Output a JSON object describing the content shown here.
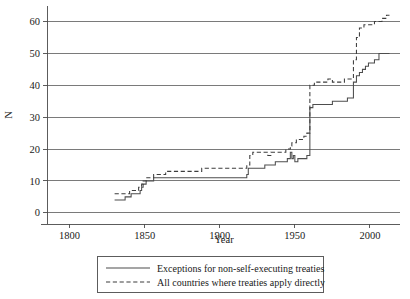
{
  "chart_data": {
    "type": "line",
    "title": "",
    "subtitle": "",
    "xlabel": "Year",
    "ylabel": "N",
    "xlim": [
      1785,
      2020
    ],
    "ylim": [
      -1,
      63
    ],
    "xticks": [
      1800,
      1850,
      1900,
      1950,
      2000
    ],
    "xtick_labels": [
      "1800",
      "1850",
      "1900",
      "1950",
      "2000"
    ],
    "yticks": [
      0,
      10,
      20,
      30,
      40,
      50,
      60
    ],
    "ytick_labels": [
      "0",
      "10",
      "20",
      "30",
      "40",
      "50",
      "60"
    ],
    "grid": "horizontal",
    "legend_position": "below-center",
    "series": [
      {
        "name": "Exceptions for non-self-executing treaties",
        "style": "solid",
        "color": "#4d4d4d",
        "points": [
          [
            1830,
            4
          ],
          [
            1837,
            4
          ],
          [
            1837,
            5
          ],
          [
            1841,
            5
          ],
          [
            1841,
            6
          ],
          [
            1847,
            6
          ],
          [
            1847,
            7
          ],
          [
            1848,
            7
          ],
          [
            1848,
            8
          ],
          [
            1849,
            8
          ],
          [
            1849,
            9
          ],
          [
            1851,
            9
          ],
          [
            1851,
            10
          ],
          [
            1856,
            10
          ],
          [
            1856,
            11
          ],
          [
            1918,
            11
          ],
          [
            1918,
            12
          ],
          [
            1919,
            12
          ],
          [
            1919,
            14
          ],
          [
            1930,
            14
          ],
          [
            1930,
            15
          ],
          [
            1937,
            15
          ],
          [
            1937,
            16
          ],
          [
            1945,
            16
          ],
          [
            1945,
            17
          ],
          [
            1947,
            17
          ],
          [
            1947,
            19
          ],
          [
            1948,
            19
          ],
          [
            1948,
            17
          ],
          [
            1949,
            17
          ],
          [
            1949,
            18
          ],
          [
            1950,
            18
          ],
          [
            1950,
            16
          ],
          [
            1952,
            16
          ],
          [
            1952,
            17
          ],
          [
            1958,
            17
          ],
          [
            1958,
            18
          ],
          [
            1960,
            18
          ],
          [
            1960,
            33
          ],
          [
            1962,
            33
          ],
          [
            1962,
            34
          ],
          [
            1975,
            34
          ],
          [
            1975,
            35
          ],
          [
            1985,
            35
          ],
          [
            1985,
            36
          ],
          [
            1989,
            36
          ],
          [
            1989,
            41
          ],
          [
            1991,
            41
          ],
          [
            1991,
            43
          ],
          [
            1993,
            43
          ],
          [
            1993,
            44
          ],
          [
            1995,
            44
          ],
          [
            1995,
            45
          ],
          [
            1997,
            45
          ],
          [
            1997,
            46
          ],
          [
            1999,
            46
          ],
          [
            1999,
            47
          ],
          [
            2003,
            47
          ],
          [
            2003,
            48
          ],
          [
            2006,
            48
          ],
          [
            2006,
            50
          ],
          [
            2013,
            50
          ]
        ]
      },
      {
        "name": "All countries where treaties apply directly",
        "style": "dashed",
        "color": "#3d3d3d",
        "points": [
          [
            1830,
            6
          ],
          [
            1840,
            6
          ],
          [
            1840,
            7
          ],
          [
            1846,
            7
          ],
          [
            1846,
            8
          ],
          [
            1848,
            8
          ],
          [
            1848,
            9
          ],
          [
            1849,
            9
          ],
          [
            1849,
            10
          ],
          [
            1851,
            10
          ],
          [
            1851,
            11
          ],
          [
            1856,
            11
          ],
          [
            1856,
            12
          ],
          [
            1864,
            12
          ],
          [
            1864,
            13
          ],
          [
            1888,
            13
          ],
          [
            1888,
            14
          ],
          [
            1918,
            14
          ],
          [
            1918,
            15
          ],
          [
            1920,
            15
          ],
          [
            1920,
            18
          ],
          [
            1922,
            18
          ],
          [
            1922,
            19
          ],
          [
            1932,
            19
          ],
          [
            1932,
            18
          ],
          [
            1934,
            18
          ],
          [
            1934,
            19
          ],
          [
            1944,
            19
          ],
          [
            1944,
            20
          ],
          [
            1947,
            20
          ],
          [
            1947,
            21
          ],
          [
            1948,
            21
          ],
          [
            1948,
            22
          ],
          [
            1951,
            22
          ],
          [
            1951,
            23
          ],
          [
            1956,
            23
          ],
          [
            1956,
            24
          ],
          [
            1958,
            24
          ],
          [
            1958,
            25
          ],
          [
            1960,
            25
          ],
          [
            1960,
            40
          ],
          [
            1963,
            40
          ],
          [
            1963,
            41
          ],
          [
            1972,
            41
          ],
          [
            1972,
            42
          ],
          [
            1975,
            42
          ],
          [
            1975,
            41
          ],
          [
            1983,
            41
          ],
          [
            1983,
            42
          ],
          [
            1989,
            42
          ],
          [
            1989,
            48
          ],
          [
            1991,
            48
          ],
          [
            1991,
            55
          ],
          [
            1993,
            55
          ],
          [
            1993,
            58
          ],
          [
            1996,
            58
          ],
          [
            1996,
            59
          ],
          [
            2003,
            59
          ],
          [
            2003,
            60
          ],
          [
            2008,
            60
          ],
          [
            2008,
            61
          ],
          [
            2011,
            61
          ],
          [
            2011,
            62
          ],
          [
            2013,
            62
          ]
        ]
      }
    ]
  },
  "legend": {
    "items": [
      {
        "label": "Exceptions for non-self-executing treaties",
        "style": "solid"
      },
      {
        "label": "All countries where treaties apply directly",
        "style": "dashed"
      }
    ]
  }
}
